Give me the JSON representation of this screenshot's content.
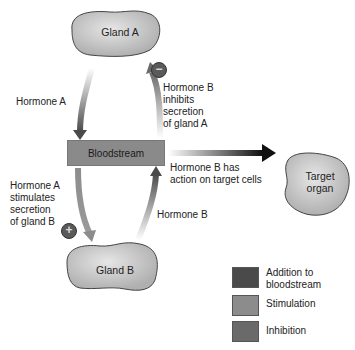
{
  "diagram": {
    "nodes": {
      "gland_a": "Gland A",
      "gland_b": "Gland B",
      "bloodstream": "Bloodstream",
      "target_organ": "Target\norgan"
    },
    "labels": {
      "hormone_a_left": "Hormone A",
      "hormone_b_inhibits": "Hormone B\ninhibits\nsecretion\nof gland A",
      "hormone_b_action": "Hormone B has\naction on target cells",
      "hormone_a_stimulates": "Hormone A\nstimulates\nsecretion\nof gland B",
      "hormone_b_bottom": "Hormone B"
    },
    "signs": {
      "inhibit": "−",
      "stimulate": "+"
    },
    "legend": [
      {
        "label": "Addition to\nbloodstream",
        "color": "#4a4a4a"
      },
      {
        "label": "Stimulation",
        "color": "#8c8c8c"
      },
      {
        "label": "Inhibition",
        "color": "#6a6a6a"
      }
    ],
    "colors": {
      "addition": "#4a4a4a",
      "stimulation": "#8c8c8c",
      "inhibition": "#6a6a6a",
      "bloodstream_box": "#8a8a8a",
      "gland_fill": "#c8c8c8"
    }
  }
}
